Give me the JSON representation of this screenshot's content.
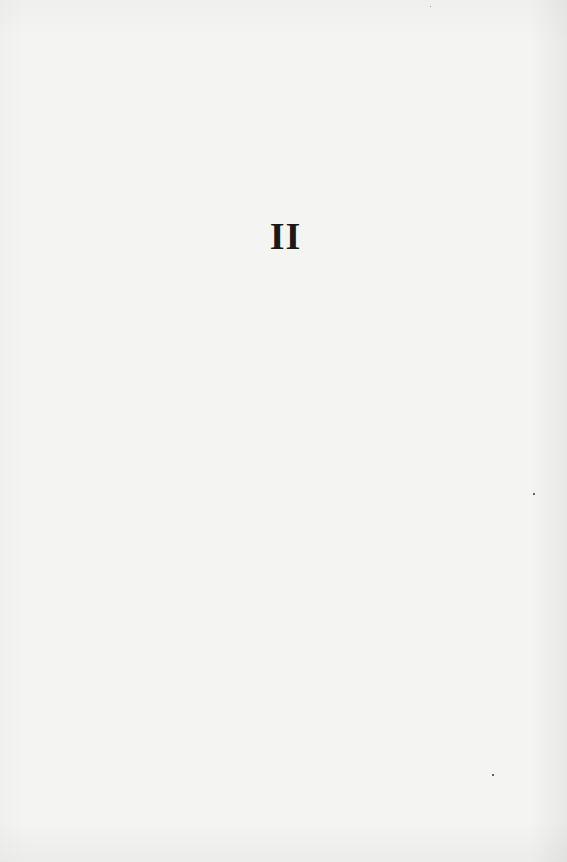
{
  "page": {
    "heading": "II",
    "background_color": "#f4f4f3",
    "text_color": "#1a1a1a"
  }
}
